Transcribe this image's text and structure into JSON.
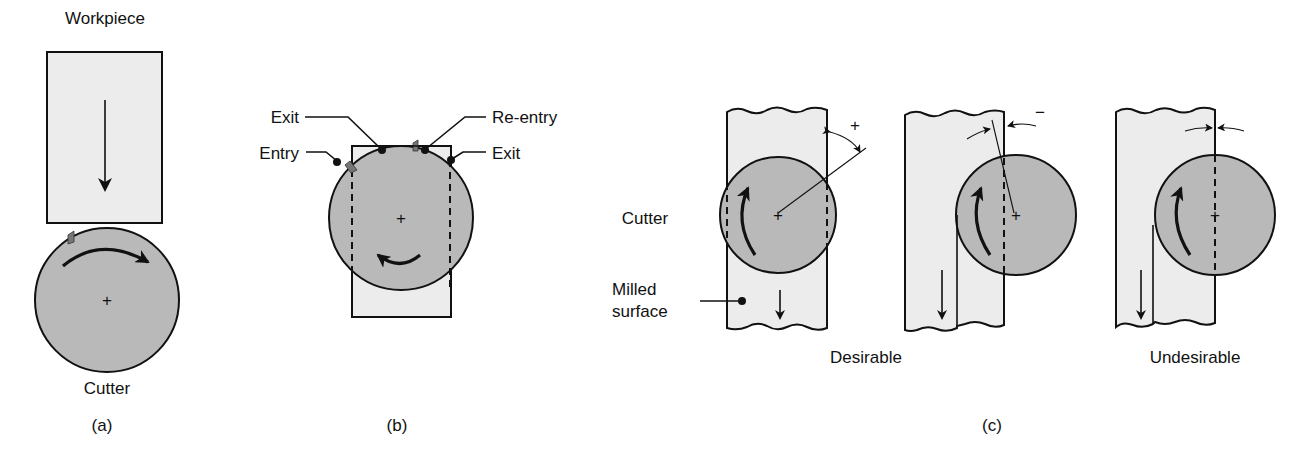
{
  "figure": {
    "panel_a": {
      "workpiece_label": "Workpiece",
      "cutter_label": "Cutter",
      "caption": "(a)"
    },
    "panel_b": {
      "labels": {
        "exit_left": "Exit",
        "entry": "Entry",
        "re_entry": "Re-entry",
        "exit_right": "Exit"
      },
      "caption": "(b)"
    },
    "panel_c": {
      "cutter_label": "Cutter",
      "milled_surface_label_line1": "Milled",
      "milled_surface_label_line2": "surface",
      "angle_positive_symbol": "+",
      "angle_negative_symbol": "−",
      "desirable_label": "Desirable",
      "undesirable_label": "Undesirable",
      "caption": "(c)"
    },
    "colors": {
      "workpiece_fill": "#ececec",
      "cutter_fill": "#b9b9b9",
      "line": "#111111",
      "tooth": "#777777"
    }
  }
}
